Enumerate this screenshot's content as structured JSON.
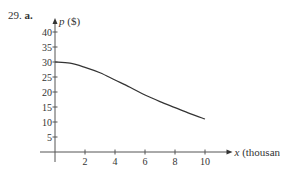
{
  "problem": {
    "number": "29.",
    "part": "a."
  },
  "chart_data": {
    "type": "line",
    "title": "",
    "xlabel": "x (thousand)",
    "ylabel": "p ($)",
    "x_ticks": [
      2,
      4,
      6,
      8,
      10
    ],
    "y_ticks": [
      5,
      10,
      15,
      20,
      25,
      30,
      35,
      40
    ],
    "xlim": [
      0,
      10
    ],
    "ylim": [
      0,
      40
    ],
    "grid": false,
    "series": [
      {
        "name": "p(x)",
        "x": [
          0,
          1,
          2,
          3,
          4,
          5,
          6,
          7,
          8,
          9,
          10
        ],
        "values": [
          30,
          29.6,
          28.2,
          26.4,
          24,
          21.6,
          19,
          16.8,
          14.8,
          12.8,
          11
        ]
      }
    ]
  },
  "colors": {
    "curve": "#333333",
    "axis": "#555555",
    "text": "#333333"
  }
}
